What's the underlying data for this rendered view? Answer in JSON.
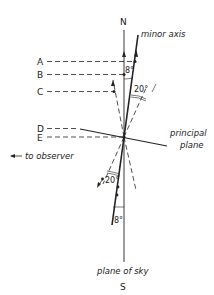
{
  "diagram": {
    "compass": {
      "north": "N",
      "south": "S"
    },
    "labels": {
      "minor_axis": "minor axis",
      "principal_plane_line1": "principal",
      "principal_plane_line2": "plane",
      "to_observer": "to observer",
      "plane_of_sky": "plane of sky"
    },
    "points": [
      {
        "id": "A",
        "label": "A"
      },
      {
        "id": "B",
        "label": "B"
      },
      {
        "id": "C",
        "label": "C"
      },
      {
        "id": "D",
        "label": "D"
      },
      {
        "id": "E",
        "label": "E"
      }
    ],
    "angles": {
      "top_small": "8°",
      "top_large": "20°",
      "bottom_large": "20°",
      "bottom_small": "8°"
    },
    "colors": {
      "ink": "#222222",
      "background": "#ffffff"
    }
  }
}
